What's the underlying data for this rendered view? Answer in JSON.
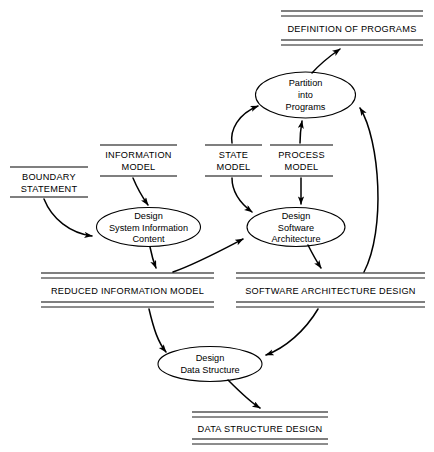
{
  "diagram": {
    "type": "data-flow-diagram",
    "title": "",
    "stores": [
      {
        "id": "definition-of-programs",
        "label": "DEFINITION OF PROGRAMS",
        "x1": 281,
        "x2": 423,
        "y_top1": 11,
        "y_top2": 16,
        "y_bot1": 40,
        "y_bot2": 45,
        "double": true
      },
      {
        "id": "boundary-statement",
        "label": "BOUNDARY STATEMENT",
        "x1": 10,
        "x2": 88,
        "y_top1": 167,
        "y_bot1": 197,
        "double": false
      },
      {
        "id": "information-model",
        "label": "INFORMATION MODEL",
        "x1": 100,
        "x2": 177,
        "y_top1": 145,
        "y_bot1": 176,
        "double": false
      },
      {
        "id": "state-model",
        "label": "STATE MODEL",
        "x1": 205,
        "x2": 262,
        "y_top1": 145,
        "y_bot1": 176,
        "double": false
      },
      {
        "id": "process-model",
        "label": "PROCESS MODEL",
        "x1": 270,
        "x2": 333,
        "y_top1": 145,
        "y_bot1": 176,
        "double": false
      },
      {
        "id": "reduced-information-model",
        "label": "REDUCED INFORMATION MODEL",
        "x1": 41,
        "x2": 214,
        "y_top1": 273,
        "y_top2": 278,
        "y_bot1": 302,
        "y_bot2": 307,
        "double": true
      },
      {
        "id": "software-architecture-design",
        "label": "SOFTWARE ARCHITECTURE DESIGN",
        "x1": 236,
        "x2": 425,
        "y_top1": 273,
        "y_top2": 278,
        "y_bot1": 302,
        "y_bot2": 307,
        "double": true
      },
      {
        "id": "data-structure-design",
        "label": "DATA STRUCTURE DESIGN",
        "x1": 192,
        "x2": 328,
        "y_top1": 412,
        "y_top2": 417,
        "y_bot1": 439,
        "y_bot2": 444,
        "double": true
      }
    ],
    "processes": [
      {
        "id": "partition-into-programs",
        "lines": [
          "Partition",
          "into",
          "Programs"
        ],
        "cx": 305.5,
        "cy": 95,
        "rx": 50,
        "ry": 23
      },
      {
        "id": "design-system-info-content",
        "lines": [
          "Design",
          "System Information",
          "Content"
        ],
        "cx": 148.5,
        "cy": 227,
        "rx": 52,
        "ry": 19.5
      },
      {
        "id": "design-software-arch",
        "lines": [
          "Design",
          "Software",
          "Architecture"
        ],
        "cx": 296,
        "cy": 227,
        "rx": 49,
        "ry": 19.5
      },
      {
        "id": "design-data-structure",
        "lines": [
          "Design",
          "Data Structure"
        ],
        "cx": 210,
        "cy": 364,
        "rx": 52,
        "ry": 17.5
      }
    ],
    "flows": [
      {
        "id": "flow-boundary-to-design-sic",
        "from": "boundary-statement",
        "to": "design-system-info-content"
      },
      {
        "id": "flow-infomodel-to-design-sic",
        "from": "information-model",
        "to": "design-system-info-content"
      },
      {
        "id": "flow-statemodel-to-partition",
        "from": "state-model",
        "to": "partition-into-programs"
      },
      {
        "id": "flow-statemodel-to-design-sa",
        "from": "state-model",
        "to": "design-software-arch"
      },
      {
        "id": "flow-processmodel-to-partition",
        "from": "process-model",
        "to": "partition-into-programs"
      },
      {
        "id": "flow-processmodel-to-design-sa",
        "from": "process-model",
        "to": "design-software-arch"
      },
      {
        "id": "flow-partition-to-definition",
        "from": "partition-into-programs",
        "to": "definition-of-programs"
      },
      {
        "id": "flow-design-sic-to-reduced",
        "from": "design-system-info-content",
        "to": "reduced-information-model"
      },
      {
        "id": "flow-reduced-to-design-sa",
        "from": "reduced-information-model",
        "to": "design-software-arch"
      },
      {
        "id": "flow-design-sa-to-swarch-store",
        "from": "design-software-arch",
        "to": "software-architecture-design"
      },
      {
        "id": "flow-swarch-store-to-partition",
        "from": "software-architecture-design",
        "to": "partition-into-programs"
      },
      {
        "id": "flow-reduced-to-design-ds",
        "from": "reduced-information-model",
        "to": "design-data-structure"
      },
      {
        "id": "flow-swarch-store-to-design-ds",
        "from": "software-architecture-design",
        "to": "design-data-structure"
      },
      {
        "id": "flow-design-ds-to-datastruct-store",
        "from": "design-data-structure",
        "to": "data-structure-design"
      }
    ],
    "colors": {
      "ink": "#000000",
      "background": "#ffffff"
    }
  }
}
